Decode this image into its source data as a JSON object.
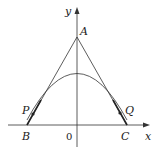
{
  "diagram": {
    "axes": {
      "x_label": "x",
      "y_label": "y",
      "origin_label": "0"
    },
    "points": {
      "A": "A",
      "B": "B",
      "C": "C",
      "P": "P",
      "Q": "Q"
    },
    "colors": {
      "stroke": "#333333",
      "text": "#222222",
      "background": "#ffffff"
    }
  }
}
